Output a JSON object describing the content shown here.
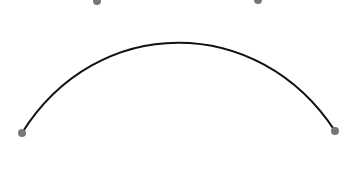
{
  "curve": {
    "type": "cubic-bezier",
    "stroke_color": "#111111",
    "stroke_width": 2,
    "start": {
      "x": 22,
      "y": 133
    },
    "control1": {
      "x": 97,
      "y": 13
    },
    "control2": {
      "x": 258,
      "y": 13
    },
    "end": {
      "x": 335,
      "y": 131
    }
  },
  "handles": {
    "color": "#777777",
    "radius": 4,
    "points": [
      {
        "name": "start-point",
        "x": 22,
        "y": 133
      },
      {
        "name": "control-point-1",
        "x": 97,
        "y": 1
      },
      {
        "name": "control-point-2",
        "x": 258,
        "y": 0
      },
      {
        "name": "end-point",
        "x": 335,
        "y": 131
      }
    ]
  }
}
